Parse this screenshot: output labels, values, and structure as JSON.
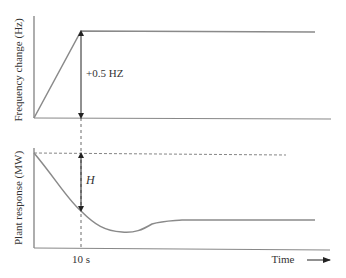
{
  "top_panel": {
    "ylabel": "Frequency change (Hz)",
    "annotation": "+0.5 HZ"
  },
  "bottom_panel": {
    "ylabel": "Plant response (MW)",
    "annotation": "H",
    "xtick": "10 s",
    "xlabel": "Time"
  },
  "colors": {
    "line": "#8a8a8a",
    "axis": "#777777",
    "arrow": "#222222",
    "text": "#333333"
  }
}
